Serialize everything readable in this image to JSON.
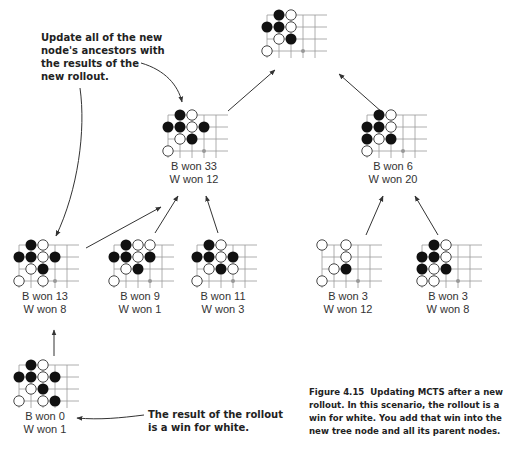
{
  "colors": {
    "grid": "#9a9a9a",
    "black_stone": "#111111",
    "white_stone_fill": "#ffffff",
    "white_stone_stroke": "#333333",
    "marker": "#999999",
    "arrow": "#333333",
    "text": "#222222"
  },
  "board": {
    "rows": 4,
    "cols": 5,
    "spacing": 12
  },
  "nodes": [
    {
      "id": "root",
      "x": 248,
      "y": 8,
      "show_stats": false,
      "b_label": "",
      "w_label": "",
      "black": [
        [
          0,
          1
        ],
        [
          1,
          0
        ],
        [
          1,
          1
        ],
        [
          2,
          2
        ]
      ],
      "white": [
        [
          0,
          2
        ],
        [
          1,
          2
        ],
        [
          2,
          1
        ],
        [
          3,
          0
        ]
      ],
      "marker": [
        [
          3,
          3
        ]
      ]
    },
    {
      "id": "left-child",
      "x": 149,
      "y": 108,
      "show_stats": true,
      "b_label": "B won 33",
      "w_label": "W won 12",
      "black": [
        [
          0,
          1
        ],
        [
          1,
          0
        ],
        [
          1,
          1
        ],
        [
          1,
          3
        ],
        [
          2,
          2
        ]
      ],
      "white": [
        [
          0,
          2
        ],
        [
          1,
          2
        ],
        [
          2,
          1
        ],
        [
          3,
          0
        ]
      ],
      "marker": [
        [
          3,
          3
        ]
      ]
    },
    {
      "id": "right-child",
      "x": 348,
      "y": 108,
      "show_stats": true,
      "b_label": "B won 6",
      "w_label": "W won 20",
      "black": [
        [
          0,
          1
        ],
        [
          1,
          0
        ],
        [
          1,
          1
        ],
        [
          2,
          0
        ],
        [
          2,
          2
        ]
      ],
      "white": [
        [
          0,
          2
        ],
        [
          1,
          2
        ],
        [
          2,
          1
        ],
        [
          3,
          0
        ]
      ],
      "marker": [
        [
          3,
          3
        ]
      ]
    },
    {
      "id": "leaf-1",
      "x": 0,
      "y": 238,
      "show_stats": true,
      "b_label": "B won 13",
      "w_label": "W won 8",
      "black": [
        [
          0,
          1
        ],
        [
          1,
          0
        ],
        [
          1,
          1
        ],
        [
          1,
          3
        ],
        [
          2,
          2
        ]
      ],
      "white": [
        [
          0,
          2
        ],
        [
          1,
          2
        ],
        [
          2,
          1
        ],
        [
          3,
          0
        ],
        [
          3,
          2
        ]
      ],
      "marker": [
        [
          3,
          3
        ]
      ]
    },
    {
      "id": "leaf-2",
      "x": 95,
      "y": 238,
      "show_stats": true,
      "b_label": "B won 9",
      "w_label": "W won 1",
      "black": [
        [
          0,
          1
        ],
        [
          1,
          0
        ],
        [
          1,
          1
        ],
        [
          1,
          3
        ],
        [
          2,
          2
        ]
      ],
      "white": [
        [
          0,
          2
        ],
        [
          0,
          3
        ],
        [
          1,
          2
        ],
        [
          2,
          1
        ],
        [
          3,
          0
        ]
      ],
      "marker": [
        [
          3,
          3
        ]
      ]
    },
    {
      "id": "leaf-3",
      "x": 178,
      "y": 238,
      "show_stats": true,
      "b_label": "B won 11",
      "w_label": "W won 3",
      "black": [
        [
          0,
          1
        ],
        [
          1,
          0
        ],
        [
          1,
          1
        ],
        [
          1,
          3
        ],
        [
          2,
          2
        ]
      ],
      "white": [
        [
          0,
          2
        ],
        [
          1,
          2
        ],
        [
          2,
          1
        ],
        [
          2,
          3
        ],
        [
          3,
          0
        ]
      ],
      "marker": [
        [
          3,
          3
        ]
      ]
    },
    {
      "id": "leaf-4",
      "x": 303,
      "y": 238,
      "show_stats": true,
      "b_label": "B won 3",
      "w_label": "W won 12",
      "black": [
        [
          2,
          2
        ]
      ],
      "white": [
        [
          0,
          0
        ],
        [
          0,
          2
        ],
        [
          1,
          2
        ],
        [
          2,
          1
        ],
        [
          3,
          0
        ]
      ],
      "marker": [
        [
          3,
          3
        ]
      ]
    },
    {
      "id": "leaf-5",
      "x": 403,
      "y": 238,
      "show_stats": true,
      "b_label": "B won 3",
      "w_label": "W won 8",
      "black": [
        [
          0,
          1
        ],
        [
          1,
          0
        ],
        [
          1,
          1
        ],
        [
          2,
          0
        ],
        [
          2,
          2
        ]
      ],
      "white": [
        [
          0,
          2
        ],
        [
          1,
          2
        ],
        [
          2,
          1
        ],
        [
          3,
          0
        ],
        [
          3,
          1
        ]
      ],
      "marker": [
        [
          3,
          3
        ]
      ]
    },
    {
      "id": "new-node",
      "x": 0,
      "y": 358,
      "show_stats": true,
      "b_label": "B won 0",
      "w_label": "W won 1",
      "black": [
        [
          0,
          1
        ],
        [
          1,
          0
        ],
        [
          1,
          1
        ],
        [
          1,
          3
        ],
        [
          2,
          2
        ],
        [
          3,
          3
        ]
      ],
      "white": [
        [
          0,
          2
        ],
        [
          1,
          2
        ],
        [
          2,
          1
        ],
        [
          3,
          0
        ],
        [
          3,
          2
        ]
      ],
      "marker": []
    }
  ],
  "callouts": {
    "ancestors": [
      "Update all of the new",
      "node's ancestors with",
      "the results of the",
      "new rollout."
    ],
    "rollout": [
      "The result of the rollout",
      "is a win for white."
    ]
  },
  "caption": {
    "figure": "Figure 4.15",
    "text": "Updating MCTS after a new rollout. In this scenario, the rollout is a win for white. You add that win into the new tree node and all its parent nodes."
  }
}
